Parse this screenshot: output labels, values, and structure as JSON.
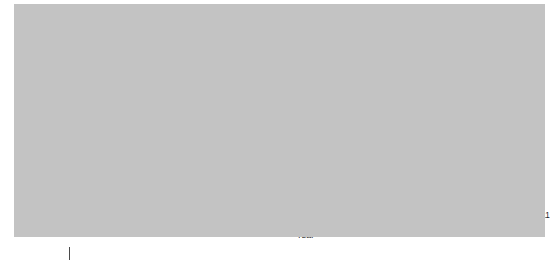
{
  "chart_data": {
    "type": "line",
    "title": "",
    "xlabel": "Year",
    "ylabel": "Percent of Electorate",
    "xlim": [
      1980,
      2011
    ],
    "ylim": [
      0,
      40
    ],
    "yticks": [
      0,
      10,
      20,
      30,
      40
    ],
    "ytick_labels": [
      "0",
      "10",
      "20",
      "30",
      "40"
    ],
    "x": [
      1980,
      1982,
      1984,
      1986,
      1988,
      1990,
      1992,
      1994,
      1996,
      1998,
      2000,
      2002,
      2004,
      2006,
      2008,
      2011
    ],
    "xtick_labels": [
      "1980",
      "1982",
      "1984",
      "1986",
      "1988",
      "1990",
      "1992",
      "1994",
      "1996",
      "1998",
      "2000",
      "2002",
      "2004",
      "2006",
      "2008",
      "2011"
    ],
    "grid": "horizontal-white",
    "legend_position": "inline-labels",
    "series": [
      {
        "name": "Moderate",
        "style": "solid",
        "color": "#1c1c1c",
        "values": [
          40,
          39.6,
          39,
          39,
          39,
          39,
          39,
          38.8,
          34.5,
          34,
          35.5,
          37,
          37,
          36.8,
          36.6,
          35
        ]
      },
      {
        "name": "Conservative",
        "style": "dashed",
        "color": "#1c1c1c",
        "values": [
          34,
          31,
          32.5,
          34.5,
          35.5,
          35.5,
          35.5,
          35,
          35.3,
          35,
          34,
          32,
          36,
          36.6,
          37,
          40
        ]
      },
      {
        "name": "Liberal",
        "style": "solid",
        "color": "#6e6e6e",
        "values": [
          25,
          26,
          25.5,
          24,
          22.5,
          22,
          26,
          26,
          26,
          25,
          26,
          25,
          24.5,
          27,
          21.5,
          21
        ]
      }
    ],
    "annotations": [
      {
        "text": "Moderate",
        "x": 1987.3,
        "y": 39.6
      },
      {
        "text": "Conservative",
        "x": 1983.4,
        "y": 33.1
      },
      {
        "text": "Liberal",
        "x": 1988.8,
        "y": 26.6
      }
    ],
    "colors": {
      "panel_background": "#c3c3c3",
      "figure_background": "#ffffff",
      "gridline": "#f2f2f2",
      "axis": "#4a4a4a",
      "moderate": "#1c1c1c",
      "conservative": "#1c1c1c",
      "liberal": "#6e6e6e"
    }
  }
}
